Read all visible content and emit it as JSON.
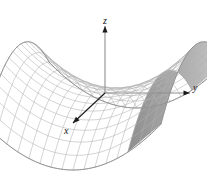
{
  "figure": {
    "title": "",
    "axis_labels": {
      "x": "x",
      "y": "y",
      "z": "z"
    }
  },
  "chart_data": {
    "type": "line",
    "title": "",
    "subtitle": "",
    "xlabel": "x",
    "ylabel": "y",
    "zlabel": "z",
    "surface": "hyperbolic paraboloid (saddle)",
    "equation": "z = y^2 - x^2",
    "xlim": [
      -1,
      1
    ],
    "ylim": [
      -1,
      1
    ],
    "zlim": [
      -1,
      1
    ],
    "grid": true,
    "legend": null,
    "annotations": [],
    "mesh": {
      "u_lines": 17,
      "v_lines": 17,
      "u_range": [
        -1,
        1
      ],
      "v_range": [
        -1,
        1
      ]
    },
    "projection": {
      "origin_px": [
        105,
        93
      ],
      "x_axis_vector_px": [
        -32,
        31
      ],
      "y_axis_vector_px": [
        88,
        0
      ],
      "z_axis_vector_px": [
        0,
        -70
      ],
      "z_scale": 46
    },
    "axis_arrows": {
      "x": {
        "from_px": [
          105,
          93
        ],
        "to_px": [
          73,
          123
        ]
      },
      "y": {
        "from_px": [
          105,
          93
        ],
        "to_px": [
          190,
          93
        ]
      },
      "z": {
        "from_px": [
          105,
          93
        ],
        "to_px": [
          105,
          26
        ]
      }
    },
    "colors": {
      "mesh": "#b0b0b0",
      "mesh_dark": "#8a8a8a",
      "outline": "#8c8c8c",
      "shaded_face": "#a8a8a8",
      "axis": "#8f8f8f",
      "axis_dark": "#1a1a1a",
      "background": "#ffffff",
      "label": "#111111"
    }
  }
}
